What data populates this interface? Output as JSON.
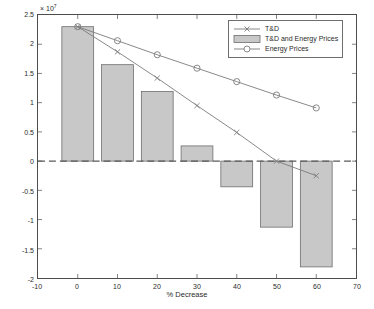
{
  "chart_data": {
    "type": "bar",
    "title": "",
    "subtitle": "",
    "xlabel": "% Decrease",
    "ylabel": "NPV (€)",
    "y_exponent_text": "× 10",
    "y_exponent_power": "7",
    "y_scale": 10000000,
    "xlim": [
      -10,
      70
    ],
    "ylim": [
      -20000000,
      25000000
    ],
    "xticks": [
      -10,
      0,
      10,
      20,
      30,
      40,
      50,
      60,
      70
    ],
    "xtick_labels": [
      "-10",
      "0",
      "10",
      "20",
      "30",
      "40",
      "50",
      "60",
      "70"
    ],
    "yticks": [
      -20000000,
      -15000000,
      -10000000,
      -5000000,
      0,
      5000000,
      10000000,
      15000000,
      20000000,
      25000000
    ],
    "ytick_labels": [
      "-2",
      "-1.5",
      "-1",
      "-0.5",
      "0",
      "0.5",
      "1",
      "1.5",
      "2",
      "2.5"
    ],
    "grid": false,
    "zero_line": true,
    "legend_position": "top-right",
    "categories": [
      0,
      10,
      20,
      30,
      40,
      50,
      60
    ],
    "bar_series": {
      "name": "T&D and Energy Prices",
      "marker": "bar-patch",
      "face_color": "#c8c8c8",
      "edge_color": "#6e6e6e",
      "bar_width": 8,
      "values": [
        23000000,
        16500000,
        11900000,
        2600000,
        -4400000,
        -11300000,
        -18100000
      ]
    },
    "series": [
      {
        "name": "T&D",
        "marker": "x",
        "color": "#7a7a7a",
        "x": [
          0,
          10,
          20,
          30,
          40,
          50,
          60
        ],
        "values": [
          23000000,
          18700000,
          14200000,
          9500000,
          4900000,
          0,
          -2500000
        ]
      },
      {
        "name": "Energy Prices",
        "marker": "o",
        "color": "#7a7a7a",
        "x": [
          0,
          10,
          20,
          30,
          40,
          50,
          60
        ],
        "values": [
          23000000,
          20600000,
          18200000,
          15900000,
          13600000,
          11300000,
          9100000
        ]
      }
    ],
    "legend_entries": [
      {
        "label": "T&D",
        "marker": "x",
        "style": "line"
      },
      {
        "label": "T&D and Energy Prices",
        "marker": "patch",
        "style": "patch"
      },
      {
        "label": "Energy Prices",
        "marker": "o",
        "style": "line"
      }
    ]
  }
}
